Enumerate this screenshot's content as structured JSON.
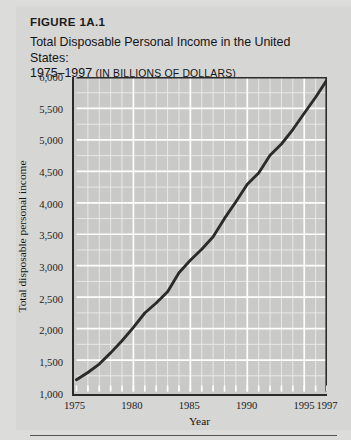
{
  "figure": {
    "number": "FIGURE 1A.1",
    "title_line1": "Total Disposable Personal Income in the United States:",
    "title_line2_years": "1975–1997 ",
    "title_line2_units": "(IN BILLIONS OF DOLLARS)"
  },
  "colors": {
    "page_background": "#dcdcda",
    "card_background": "#d6d6d4",
    "plot_background": "#c9c9c7",
    "gridline_major": "#ffffff",
    "gridline_minor": "#e8e8e6",
    "axis": "#2b2b2b",
    "series_line": "#2b2b2b",
    "text": "#141414",
    "rule": "#53534f"
  },
  "chart_data": {
    "type": "line",
    "title": "Total Disposable Personal Income in the United States: 1975–1997 (IN BILLIONS OF DOLLARS)",
    "xlabel": "Year",
    "ylabel": "Total disposable personal income",
    "xlim": [
      1975,
      1997
    ],
    "ylim": [
      1000,
      6000
    ],
    "grid": true,
    "legend": "none",
    "y_ticks": [
      1000,
      1500,
      2000,
      2500,
      3000,
      3500,
      4000,
      4500,
      5000,
      5500,
      6000
    ],
    "y_tick_labels": [
      "1,000",
      "1,500",
      "2,000",
      "2,500",
      "3,000",
      "3,500",
      "4,000",
      "4,500",
      "5,000",
      "5,500",
      "6,000"
    ],
    "x_ticks": [
      1975,
      1980,
      1985,
      1990,
      1995,
      1997
    ],
    "x_tick_labels": [
      "1975",
      "1980",
      "1985",
      "1990",
      "1995",
      "1997"
    ],
    "y_minor_step": 250,
    "x_minor_step": 1,
    "series": [
      {
        "name": "Total disposable personal income",
        "x": [
          1975,
          1976,
          1977,
          1978,
          1979,
          1980,
          1981,
          1982,
          1983,
          1984,
          1985,
          1986,
          1987,
          1988,
          1989,
          1990,
          1991,
          1992,
          1993,
          1994,
          1995,
          1996,
          1997
        ],
        "values": [
          1187,
          1302,
          1436,
          1614,
          1808,
          2019,
          2248,
          2407,
          2587,
          2887,
          3086,
          3262,
          3459,
          3752,
          4016,
          4294,
          4475,
          4755,
          4935,
          5165,
          5423,
          5678,
          5955
        ]
      }
    ]
  }
}
